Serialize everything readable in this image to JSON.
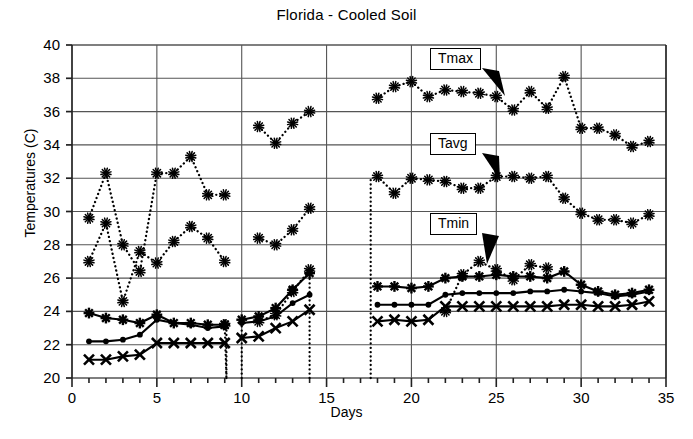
{
  "chart_data": {
    "type": "line",
    "title": "Florida - Cooled Soil",
    "xlabel": "Days",
    "ylabel": "Temperatures (C)",
    "xlim": [
      0,
      35
    ],
    "ylim": [
      20,
      40
    ],
    "xticks": [
      0,
      5,
      10,
      15,
      20,
      25,
      30,
      35
    ],
    "yticks": [
      20,
      22,
      24,
      26,
      28,
      30,
      32,
      34,
      36,
      38,
      40
    ],
    "xtick_minor_step": 1,
    "grid": true,
    "legend": "none",
    "annotations": [
      {
        "label": "Tmax",
        "series": "Tmax",
        "box_x": 430,
        "box_y": 48,
        "tip_x": 505,
        "tip_y": 96
      },
      {
        "label": "Tavg",
        "series": "Tavg",
        "box_x": 430,
        "box_y": 133,
        "tip_x": 500,
        "tip_y": 180
      },
      {
        "label": "Tmin",
        "series": "Tmin",
        "box_x": 430,
        "box_y": 213,
        "tip_x": 487,
        "tip_y": 264
      }
    ],
    "series": [
      {
        "name": "Tmax",
        "marker": "asterisk",
        "linestyle": "dotted",
        "segments": [
          {
            "x": [
              1,
              2,
              3,
              4,
              5,
              6,
              7,
              8,
              9
            ],
            "y": [
              29.6,
              32.3,
              28.0,
              26.4,
              32.3,
              32.3,
              33.3,
              31.0,
              31.0
            ]
          },
          {
            "x": [
              11,
              12,
              13,
              14
            ],
            "y": [
              35.1,
              34.1,
              35.3,
              36.0
            ]
          },
          {
            "x": [
              18,
              19,
              20,
              21,
              22,
              23,
              24,
              25,
              26,
              27,
              28,
              29,
              30,
              31,
              32,
              33,
              34
            ],
            "y": [
              36.8,
              37.5,
              37.8,
              36.9,
              37.3,
              37.2,
              37.1,
              36.9,
              36.1,
              37.2,
              36.2,
              38.1,
              35.0,
              35.0,
              34.6,
              33.9,
              34.2
            ]
          }
        ]
      },
      {
        "name": "Tavg",
        "marker": "asterisk",
        "linestyle": "dotted",
        "segments": [
          {
            "x": [
              1,
              2,
              3,
              4,
              5,
              6,
              7,
              8,
              9
            ],
            "y": [
              27.0,
              29.3,
              24.6,
              27.6,
              26.9,
              28.2,
              29.1,
              28.4,
              27.0
            ]
          },
          {
            "x": [
              11,
              12,
              13,
              14
            ],
            "y": [
              28.4,
              28.0,
              28.9,
              30.2
            ]
          },
          {
            "x": [
              18,
              19,
              20,
              21,
              22,
              23,
              24,
              25,
              26,
              27,
              28,
              29,
              30,
              31,
              32,
              33,
              34
            ],
            "y": [
              32.1,
              31.1,
              32.0,
              31.9,
              31.8,
              31.4,
              31.4,
              32.1,
              32.1,
              32.0,
              32.1,
              30.8,
              29.9,
              29.5,
              29.5,
              29.3,
              29.8
            ]
          }
        ]
      },
      {
        "name": "Tmin-a",
        "marker": "star",
        "linestyle": "solid",
        "segments": [
          {
            "x": [
              1,
              2,
              3,
              4,
              5,
              6,
              7,
              8,
              9
            ],
            "y": [
              23.9,
              23.6,
              23.5,
              23.3,
              23.8,
              23.3,
              23.3,
              23.2,
              23.2
            ]
          },
          {
            "x": [
              10,
              11,
              12,
              13,
              14
            ],
            "y": [
              23.5,
              23.7,
              24.2,
              25.3,
              26.3
            ]
          },
          {
            "x": [
              18,
              19,
              20,
              21,
              22,
              23,
              24,
              25,
              26,
              27,
              28,
              29,
              30,
              31,
              32,
              33,
              34
            ],
            "y": [
              25.5,
              25.5,
              25.4,
              25.5,
              26.0,
              26.1,
              26.1,
              26.2,
              26.1,
              26.1,
              26.0,
              26.4,
              25.6,
              25.2,
              25.0,
              25.1,
              25.3
            ]
          }
        ]
      },
      {
        "name": "Tmin-b",
        "marker": "dot",
        "linestyle": "solid",
        "segments": [
          {
            "x": [
              1,
              2,
              3,
              4,
              5,
              6,
              7,
              8,
              9
            ],
            "y": [
              22.2,
              22.2,
              22.3,
              22.6,
              23.5,
              23.3,
              23.2,
              23.0,
              23.1
            ]
          },
          {
            "x": [
              10,
              11,
              12,
              13,
              14
            ],
            "y": [
              23.3,
              23.4,
              23.7,
              24.5,
              25.0
            ]
          },
          {
            "x": [
              18,
              19,
              20,
              21,
              22,
              23,
              24,
              25,
              26,
              27,
              28,
              29,
              30,
              31,
              32,
              33,
              34
            ],
            "y": [
              24.4,
              24.4,
              24.4,
              24.4,
              25.0,
              25.1,
              25.1,
              25.1,
              25.1,
              25.2,
              25.2,
              25.3,
              25.2,
              25.1,
              24.9,
              25.0,
              25.2
            ]
          }
        ]
      },
      {
        "name": "Tmin-c",
        "marker": "cross",
        "linestyle": "solid",
        "segments": [
          {
            "x": [
              1,
              2,
              3,
              4,
              5,
              6,
              7,
              8,
              9
            ],
            "y": [
              21.1,
              21.1,
              21.3,
              21.4,
              22.1,
              22.1,
              22.1,
              22.1,
              22.1
            ]
          },
          {
            "x": [
              10,
              11,
              12,
              13,
              14
            ],
            "y": [
              22.4,
              22.5,
              23.0,
              23.4,
              24.1
            ]
          },
          {
            "x": [
              18,
              19,
              20,
              21,
              22,
              23,
              24,
              25,
              26,
              27,
              28,
              29,
              30,
              31,
              32,
              33,
              34
            ],
            "y": [
              23.4,
              23.5,
              23.4,
              23.5,
              24.3,
              24.3,
              24.3,
              24.3,
              24.3,
              24.3,
              24.3,
              24.4,
              24.4,
              24.3,
              24.3,
              24.4,
              24.6
            ]
          }
        ]
      },
      {
        "name": "Tsoil-extra",
        "marker": "asterisk",
        "linestyle": "dotted",
        "segments": [
          {
            "x": [
              9,
              9.1
            ],
            "y": [
              23.2,
              20.0
            ]
          },
          {
            "x": [
              11,
              12,
              13,
              14
            ],
            "y": [
              23.4,
              23.8,
              25.2,
              26.5
            ]
          },
          {
            "x": [
              22,
              23,
              24,
              25,
              26,
              27,
              28
            ],
            "y": [
              24.0,
              26.2,
              27.0,
              26.5,
              25.9,
              26.8,
              26.6
            ]
          }
        ]
      }
    ]
  }
}
